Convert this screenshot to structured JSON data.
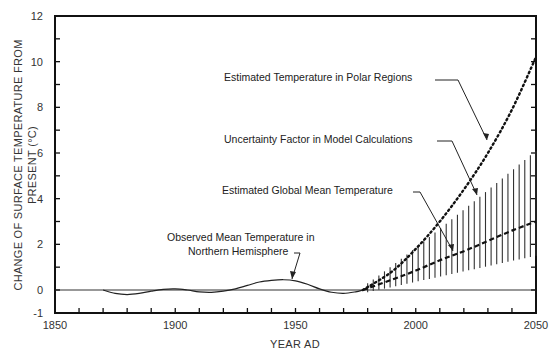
{
  "chart_data": {
    "type": "line",
    "title": "",
    "xlabel": "YEAR AD",
    "ylabel_lines": [
      "CHANGE OF SURFACE TEMPERATURE FROM",
      "PRESENT (°C)"
    ],
    "ylabel": "CHANGE OF SURFACE TEMPERATURE FROM PRESENT (°C)",
    "xlim": [
      1850,
      2050
    ],
    "ylim": [
      -1,
      12
    ],
    "x_ticks_major": [
      1850,
      1900,
      1950,
      2000,
      2050
    ],
    "x_ticks_minor_step": 10,
    "y_tick_labels": [
      -1,
      0,
      2,
      4,
      6,
      8,
      10,
      12
    ],
    "y_ticks_minor_step": 1,
    "grid": false,
    "baseline": 0,
    "series": [
      {
        "name": "Observed Mean Temperature in Northern Hemisphere",
        "style": "solid",
        "x": [
          1870,
          1875,
          1880,
          1885,
          1890,
          1895,
          1900,
          1905,
          1910,
          1915,
          1920,
          1925,
          1930,
          1935,
          1940,
          1945,
          1950,
          1955,
          1960,
          1965,
          1970,
          1975,
          1978
        ],
        "y": [
          0,
          -0.15,
          -0.2,
          -0.15,
          -0.05,
          0.03,
          0.05,
          0.0,
          -0.08,
          -0.1,
          -0.05,
          0.05,
          0.2,
          0.35,
          0.42,
          0.45,
          0.4,
          0.25,
          0.05,
          -0.1,
          -0.15,
          -0.08,
          0
        ]
      },
      {
        "name": "Estimated Global Mean Temperature",
        "style": "dashed",
        "x": [
          1978,
          1990,
          2000,
          2010,
          2020,
          2030,
          2040,
          2050
        ],
        "y": [
          0,
          0.45,
          0.85,
          1.3,
          1.7,
          2.15,
          2.6,
          3.0
        ]
      },
      {
        "name": "Estimated Temperature in Polar Regions",
        "style": "dotted",
        "x": [
          1978,
          1990,
          2000,
          2010,
          2020,
          2030,
          2040,
          2050
        ],
        "y": [
          0,
          0.8,
          1.8,
          3.0,
          4.4,
          6.0,
          7.9,
          10.2
        ]
      },
      {
        "name": "Uncertainty Factor in Model Calculations",
        "style": "hatched-band",
        "x": [
          1980,
          2050
        ],
        "upper": [
          0.3,
          6.1
        ],
        "lower": [
          -0.1,
          1.5
        ]
      }
    ],
    "annotations": [
      {
        "text": "Estimated Temperature in Polar Regions",
        "points_to": "polar"
      },
      {
        "text": "Uncertainty Factor in Model Calculations",
        "points_to": "uncertainty"
      },
      {
        "text": "Estimated Global Mean Temperature",
        "points_to": "global"
      },
      {
        "text_lines": [
          "Observed Mean  Temperature in",
          "Northern Hemisphere"
        ],
        "points_to": "observed"
      }
    ]
  },
  "labels": {
    "polar": "Estimated Temperature in Polar Regions",
    "uncertainty": "Uncertainty Factor in Model Calculations",
    "global": "Estimated Global Mean Temperature",
    "observed_line1": "Observed Mean  Temperature in",
    "observed_line2": "Northern Hemisphere",
    "xlabel": "YEAR AD",
    "ylabel_line1": "CHANGE OF SURFACE TEMPERATURE FROM",
    "ylabel_line2": "PRESENT (°C)"
  }
}
